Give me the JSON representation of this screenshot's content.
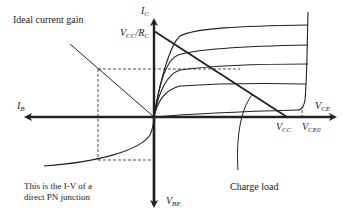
{
  "labels": {
    "ideal_gain": "Ideal  current gain",
    "pn_note_line1": "This is the I-V of a",
    "pn_note_line2": "direct PN junction",
    "charge_load": "Charge load"
  },
  "axes": {
    "ic": {
      "main": "I",
      "sub": "C"
    },
    "ib": {
      "main": "I",
      "sub": "B"
    },
    "vce": {
      "main": "V",
      "sub": "CE"
    },
    "vbe": {
      "main": "V",
      "sub": "BE"
    },
    "vcc_rc": {
      "main1": "V",
      "sub1": "CC",
      "sep": "/R",
      "sub2": "C"
    },
    "vcc": {
      "main": "V",
      "sub": "CC"
    },
    "vceo": {
      "main": "V",
      "sub": "CE0"
    }
  },
  "colors": {
    "line": "#222222",
    "background": "#ffffff"
  }
}
